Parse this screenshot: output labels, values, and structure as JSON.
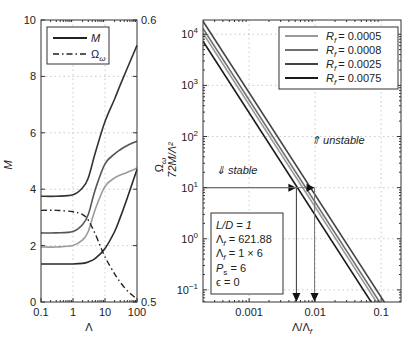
{
  "chart_data": [
    {
      "type": "line",
      "title": "",
      "xlabel": "Λ",
      "ylabel": "M",
      "y2label": "Ωω",
      "xscale": "log",
      "xlim": [
        0.1,
        100
      ],
      "ylim": [
        0,
        10
      ],
      "y2lim": [
        0.5,
        0.6
      ],
      "grid": true,
      "xticks": [
        0.1,
        1,
        10,
        100
      ],
      "xtick_labels": [
        "0.1",
        "1",
        "10",
        "100"
      ],
      "yticks": [
        0,
        2,
        4,
        6,
        8,
        10
      ],
      "ytick_labels": [
        "0",
        "2",
        "4",
        "6",
        "8",
        "10"
      ],
      "y2ticks": [
        0.5,
        0.6
      ],
      "y2tick_labels": [
        "0.5",
        "0.6"
      ],
      "legend": {
        "placement": "top-left",
        "entries": [
          {
            "label": "M",
            "style": "solid"
          },
          {
            "label": "Ωω",
            "style": "dash-dot"
          }
        ]
      },
      "x": [
        0.1,
        0.3,
        1,
        2,
        3,
        5,
        10,
        20,
        30,
        50,
        100
      ],
      "series": [
        {
          "name": "M (curve 1)",
          "axis": "left",
          "color": "#333333",
          "style": "solid",
          "values": [
            3.75,
            3.75,
            3.8,
            4.05,
            4.4,
            5.3,
            6.4,
            7.2,
            7.7,
            8.3,
            9.1
          ]
        },
        {
          "name": "M (curve 2)",
          "axis": "left",
          "color": "#555555",
          "style": "solid",
          "values": [
            2.45,
            2.45,
            2.5,
            2.75,
            3.1,
            4.0,
            4.9,
            5.25,
            5.4,
            5.55,
            5.7
          ]
        },
        {
          "name": "M (curve 3)",
          "axis": "left",
          "color": "#9a9a9a",
          "style": "solid",
          "values": [
            1.95,
            1.95,
            2.0,
            2.2,
            2.5,
            3.3,
            4.1,
            4.4,
            4.5,
            4.6,
            4.75
          ]
        },
        {
          "name": "M (curve 4)",
          "axis": "left",
          "color": "#2a2a2a",
          "style": "solid",
          "values": [
            1.35,
            1.35,
            1.35,
            1.37,
            1.42,
            1.55,
            1.9,
            2.5,
            3.0,
            3.7,
            4.7
          ]
        },
        {
          "name": "Ωω",
          "axis": "right",
          "color": "#222222",
          "style": "dash-dot",
          "values": [
            0.5325,
            0.5325,
            0.532,
            0.531,
            0.529,
            0.524,
            0.516,
            0.51,
            0.507,
            0.504,
            0.501
          ]
        }
      ]
    },
    {
      "type": "line",
      "title": "",
      "xlabel": "Λ/Λf",
      "ylabel": "72M/Λ²",
      "xscale": "log",
      "yscale": "log",
      "xlim": [
        0.0002,
        0.2
      ],
      "ylim": [
        0.058,
        19000
      ],
      "grid": true,
      "xticks": [
        0.001,
        0.01,
        0.1
      ],
      "xtick_labels": [
        "0.001",
        "0.01",
        "0.1"
      ],
      "yticks": [
        0.1,
        1,
        10,
        100,
        1000,
        10000
      ],
      "ytick_labels": [
        "10−1",
        "100",
        "101",
        "102",
        "103",
        "104"
      ],
      "ytick_exponents": [
        "-1",
        "0",
        "1",
        "2",
        "3",
        "4"
      ],
      "legend": {
        "placement": "top-right",
        "entries": [
          {
            "label": "Rf = 0.0005",
            "color": "#9a9a9a"
          },
          {
            "label": "Rf = 0.0008",
            "color": "#707070"
          },
          {
            "label": "Rf = 0.0025",
            "color": "#444444"
          },
          {
            "label": "Rf = 0.0075",
            "color": "#1a1a1a"
          }
        ]
      },
      "series": [
        {
          "name": "Rf = 0.0025",
          "color": "#444444",
          "x": [
            0.0002,
            0.17
          ],
          "values": [
            18000,
            0.025
          ]
        },
        {
          "name": "Rf = 0.0008",
          "color": "#707070",
          "x": [
            0.0002,
            0.17
          ],
          "values": [
            13000,
            0.018
          ]
        },
        {
          "name": "Rf = 0.0005",
          "color": "#9a9a9a",
          "x": [
            0.0002,
            0.17
          ],
          "values": [
            10500,
            0.0145
          ]
        },
        {
          "name": "Rf = 0.0075",
          "color": "#1a1a1a",
          "x": [
            0.0002,
            0.17
          ],
          "values": [
            7300,
            0.01
          ]
        }
      ],
      "annotations": {
        "unstable": "⇑ unstable",
        "stable": "⇓ stable",
        "threshold_y": 10,
        "crossings_x": [
          0.0052,
          0.0098
        ],
        "params": [
          "L/D = 1",
          "Λf = 621.88",
          "Λf = 1 × 6",
          "Ps = 6",
          "ε = 0"
        ]
      }
    }
  ],
  "labels": {
    "left_xlabel": "Λ",
    "left_ylabel": "M",
    "left_y2label_main": "Ω",
    "left_y2label_sub": "ω",
    "legend_m": "M",
    "legend_omega_main": "Ω",
    "legend_omega_sub": "ω",
    "right_xlabel_main": "Λ/Λ",
    "right_xlabel_sub": "f",
    "right_ylabel": "72M/Λ²",
    "unstable": "⇑ unstable",
    "stable": "⇓ stable",
    "rf": "R",
    "rf_sub": "f",
    "rf_values": [
      "= 0.0005",
      "= 0.0008",
      "= 0.0025",
      "= 0.0075"
    ],
    "param_ld": "L/D = 1",
    "param_lf1_main": "Λ",
    "param_lf1_sub": "f",
    "param_lf1_val": " = 621.88",
    "param_lf2_main": "Λ",
    "param_lf2_sub": "f",
    "param_lf2_val": " = 1 × 6",
    "param_ps_main": "P",
    "param_ps_sub": "s",
    "param_ps_val": " = 6",
    "param_eps": "ϵ = 0"
  }
}
